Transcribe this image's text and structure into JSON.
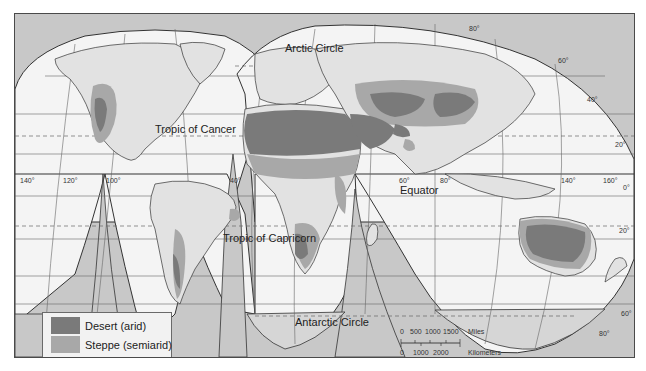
{
  "map": {
    "title": "World Desert and Steppe Climates",
    "projection": "Interrupted homolosine",
    "colors": {
      "ocean": "#f4f4f4",
      "land": "#e2e2e2",
      "outside": "#c8c8c8",
      "desert": "#7a7a7a",
      "steppe": "#a8a8a8",
      "graticule": "#555555"
    },
    "labels": {
      "arctic_circle": "Arctic Circle",
      "tropic_cancer": "Tropic of Cancer",
      "equator": "Equator",
      "tropic_capricorn": "Tropic of Capricorn",
      "antarctic_circle": "Antarctic Circle"
    },
    "longitude_labels": [
      "140°",
      "120°",
      "100°",
      "40°",
      "60°",
      "80°",
      "140°",
      "160°"
    ],
    "latitude_labels": [
      "80°",
      "60°",
      "40°",
      "20°",
      "0°",
      "20°",
      "60°",
      "80°"
    ]
  },
  "legend": {
    "items": [
      {
        "label": "Desert (arid)",
        "color": "#7a7a7a"
      },
      {
        "label": "Steppe (semiarid)",
        "color": "#a8a8a8"
      }
    ]
  },
  "scale_bar": {
    "miles_ticks": [
      "0",
      "500",
      "1000",
      "1500"
    ],
    "miles_unit": "Miles",
    "km_ticks": [
      "0",
      "1000",
      "2000"
    ],
    "km_unit": "Kilometers"
  }
}
